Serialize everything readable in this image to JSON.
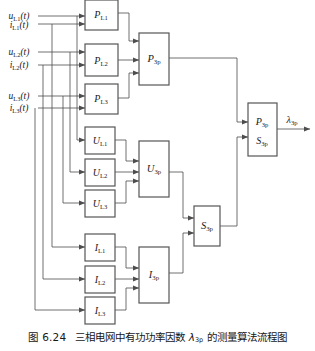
{
  "figure": {
    "caption_label": "图 6.24",
    "caption_text_pre": "三相电网中有功功率因数 ",
    "caption_symbol": "λ",
    "caption_symbol_sub": "3p",
    "caption_text_post": " 的测量算法流程图",
    "line_color": "#4d4d4d",
    "block_border_color": "#555555",
    "text_color": "#1a1a1a",
    "background": "#ffffff"
  },
  "inputs": [
    {
      "id": "u-l1",
      "symbol": "u",
      "sub": "L1",
      "arg": "(t)",
      "label": "u_L1(t)",
      "y": 16
    },
    {
      "id": "i-l1",
      "symbol": "i",
      "sub": "L1",
      "arg": "(t)",
      "label": "i_L1(t)",
      "y": 24
    },
    {
      "id": "u-l2",
      "symbol": "u",
      "sub": "L2",
      "arg": "(t)",
      "label": "u_L2(t)",
      "y": 52
    },
    {
      "id": "i-l2",
      "symbol": "i",
      "sub": "L2",
      "arg": "(t)",
      "label": "i_L2(t)",
      "y": 65
    },
    {
      "id": "u-l3",
      "symbol": "u",
      "sub": "L3",
      "arg": "(t)",
      "label": "u_L3(t)",
      "y": 96
    },
    {
      "id": "i-l3",
      "symbol": "i",
      "sub": "L3",
      "arg": "(t)",
      "label": "i_L3(t)",
      "y": 108
    }
  ],
  "blocks": {
    "power_phase": [
      {
        "id": "p-l1",
        "symbol": "P",
        "sub": "L1",
        "label": "P_L1"
      },
      {
        "id": "p-l2",
        "symbol": "P",
        "sub": "L2",
        "label": "P_L2"
      },
      {
        "id": "p-l3",
        "symbol": "P",
        "sub": "L3",
        "label": "P_L3"
      }
    ],
    "voltage_phase": [
      {
        "id": "u-l1b",
        "symbol": "U",
        "sub": "L1",
        "label": "U_L1"
      },
      {
        "id": "u-l2b",
        "symbol": "U",
        "sub": "L2",
        "label": "U_L2"
      },
      {
        "id": "u-l3b",
        "symbol": "U",
        "sub": "L3",
        "label": "U_L3"
      }
    ],
    "current_phase": [
      {
        "id": "i-l1b",
        "symbol": "I",
        "sub": "L1",
        "label": "I_L1"
      },
      {
        "id": "i-l2b",
        "symbol": "I",
        "sub": "L2",
        "label": "I_L2"
      },
      {
        "id": "i-l3b",
        "symbol": "I",
        "sub": "L3",
        "label": "I_L3"
      }
    ],
    "aggregate": [
      {
        "id": "p-3p",
        "symbol": "P",
        "sub": "3p",
        "label": "P_3p"
      },
      {
        "id": "u-3p",
        "symbol": "U",
        "sub": "3p",
        "label": "U_3p"
      },
      {
        "id": "i-3p",
        "symbol": "I",
        "sub": "3p",
        "label": "I_3p"
      },
      {
        "id": "s-3p",
        "symbol": "S",
        "sub": "3p",
        "label": "S_3p"
      }
    ],
    "divider": {
      "id": "lambda-divider",
      "numerator_symbol": "P",
      "numerator_sub": "3p",
      "denominator_symbol": "S",
      "denominator_sub": "3p",
      "label": "P_3p / S_3p"
    }
  },
  "output": {
    "id": "lambda-3p",
    "symbol": "λ",
    "sub": "3p",
    "label": "λ_3p"
  }
}
